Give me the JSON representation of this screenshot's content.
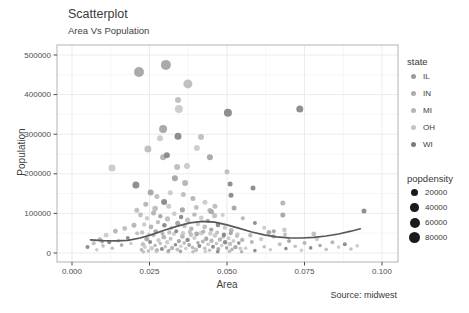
{
  "chart": {
    "title": "Scatterplot",
    "subtitle": "Area Vs Population",
    "xlabel": "Area",
    "ylabel": "Population",
    "caption": "Source: midwest"
  },
  "legend": {
    "state_title": "state",
    "size_title": "popdensity",
    "states": [
      {
        "label": "IL",
        "color": "#9b9b9b"
      },
      {
        "label": "IN",
        "color": "#acacac"
      },
      {
        "label": "MI",
        "color": "#b6b6b6"
      },
      {
        "label": "OH",
        "color": "#c4c4c4"
      },
      {
        "label": "WI",
        "color": "#7b7b7b"
      }
    ],
    "sizes": [
      {
        "label": "20000",
        "d": 7.5
      },
      {
        "label": "40000",
        "d": 8.5
      },
      {
        "label": "60000",
        "d": 10
      },
      {
        "label": "80000",
        "d": 11.5
      }
    ],
    "size_color": "#1a1a1a"
  },
  "chart_data": {
    "type": "scatter",
    "title": "Scatterplot",
    "subtitle": "Area Vs Population",
    "xlabel": "Area",
    "ylabel": "Population",
    "caption": "Source: midwest",
    "xlim": [
      0,
      0.1
    ],
    "ylim": [
      0,
      500000
    ],
    "x_ticks": [
      "0.000",
      "0.025",
      "0.050",
      "0.075",
      "0.100"
    ],
    "y_ticks": [
      "0",
      "100000",
      "200000",
      "300000",
      "400000",
      "500000"
    ],
    "grid": true,
    "legend_position": "right",
    "series_label": "state",
    "size_label": "popdensity",
    "colors": {
      "IL": "#9b9b9b",
      "IN": "#acacac",
      "MI": "#b6b6b6",
      "OH": "#c4c4c4",
      "WI": "#7b7b7b",
      "smooth": "#55585c",
      "grid_major": "#ebebeb",
      "grid_minor": "#f6f6f6",
      "panel_border": "#b3b3b3",
      "tick": "#4d4d4d",
      "size_key": "#1a1a1a"
    },
    "smooth_line": [
      [
        0.006,
        33000
      ],
      [
        0.01,
        31000
      ],
      [
        0.014,
        30500
      ],
      [
        0.018,
        32000
      ],
      [
        0.022,
        38000
      ],
      [
        0.026,
        47000
      ],
      [
        0.03,
        58000
      ],
      [
        0.034,
        68000
      ],
      [
        0.038,
        76000
      ],
      [
        0.042,
        80000
      ],
      [
        0.046,
        78000
      ],
      [
        0.05,
        71000
      ],
      [
        0.054,
        62000
      ],
      [
        0.058,
        53000
      ],
      [
        0.062,
        46000
      ],
      [
        0.066,
        41000
      ],
      [
        0.07,
        38500
      ],
      [
        0.074,
        38000
      ],
      [
        0.078,
        39500
      ],
      [
        0.082,
        43000
      ],
      [
        0.086,
        48000
      ],
      [
        0.09,
        55000
      ],
      [
        0.093,
        61000
      ]
    ],
    "points": [
      [
        0.0216,
        457000,
        "IL",
        5
      ],
      [
        0.0303,
        475000,
        "IL",
        5
      ],
      [
        0.0374,
        427000,
        "MI",
        4.5
      ],
      [
        0.0345,
        364000,
        "OH",
        4
      ],
      [
        0.0342,
        386000,
        "MI",
        3
      ],
      [
        0.0503,
        354000,
        "WI",
        4
      ],
      [
        0.0735,
        364000,
        "WI",
        3.5
      ],
      [
        0.0294,
        313000,
        "IL",
        4
      ],
      [
        0.0342,
        295000,
        "WI",
        3.5
      ],
      [
        0.0416,
        293000,
        "MI",
        3
      ],
      [
        0.0284,
        290000,
        "OH",
        3
      ],
      [
        0.0245,
        263000,
        "MI",
        3.5
      ],
      [
        0.0294,
        242000,
        "IN",
        3
      ],
      [
        0.0306,
        247000,
        "WI",
        3
      ],
      [
        0.0403,
        265000,
        "OH",
        3
      ],
      [
        0.0445,
        242000,
        "IL",
        3
      ],
      [
        0.0129,
        215000,
        "OH",
        3.5
      ],
      [
        0.0206,
        172000,
        "WI",
        3.5
      ],
      [
        0.0339,
        217000,
        "MI",
        3
      ],
      [
        0.0371,
        220000,
        "OH",
        3
      ],
      [
        0.05,
        205000,
        "MI",
        2.5
      ],
      [
        0.051,
        174000,
        "WI",
        2.5
      ],
      [
        0.0332,
        189000,
        "IL",
        3
      ],
      [
        0.0365,
        177000,
        "IN",
        3
      ],
      [
        0.0584,
        164000,
        "WI",
        2.5
      ],
      [
        0.068,
        126000,
        "IN",
        2.5
      ],
      [
        0.068,
        96000,
        "IL",
        2.5
      ],
      [
        0.0942,
        106000,
        "WI",
        2.5
      ],
      [
        0.0297,
        129000,
        "WI",
        3
      ],
      [
        0.0513,
        146000,
        "WI",
        2.5
      ],
      [
        0.0523,
        114000,
        "IL",
        2.5
      ],
      [
        0.0254,
        153000,
        "IL",
        3
      ],
      [
        0.0274,
        143000,
        "MI",
        2.5
      ],
      [
        0.0317,
        152000,
        "OH",
        2.5
      ],
      [
        0.0359,
        148000,
        "MI",
        2.5
      ],
      [
        0.039,
        138000,
        "IN",
        2.5
      ],
      [
        0.0429,
        128000,
        "OH",
        2.5
      ],
      [
        0.0461,
        118000,
        "MI",
        2.5
      ],
      [
        0.0238,
        123000,
        "IN",
        2.5
      ],
      [
        0.0209,
        108000,
        "MI",
        2.5
      ],
      [
        0.045,
        104000,
        "IL",
        2.5
      ],
      [
        0.0486,
        96000,
        "OH",
        2
      ],
      [
        0.0551,
        88000,
        "IN",
        2
      ],
      [
        0.059,
        76000,
        "WI",
        2
      ],
      [
        0.062,
        64000,
        "OH",
        2
      ],
      [
        0.0651,
        55000,
        "IL",
        2
      ],
      [
        0.0687,
        47000,
        "MI",
        2
      ],
      [
        0.0221,
        96000,
        "MI",
        2.4
      ],
      [
        0.0242,
        88000,
        "OH",
        2.2
      ],
      [
        0.0263,
        101000,
        "IN",
        2.5
      ],
      [
        0.0285,
        93000,
        "IL",
        2.2
      ],
      [
        0.0308,
        86000,
        "MI",
        2.6
      ],
      [
        0.033,
        99000,
        "OH",
        2.3
      ],
      [
        0.0352,
        91000,
        "WI",
        2.2
      ],
      [
        0.0373,
        83000,
        "MI",
        2.5
      ],
      [
        0.0395,
        97000,
        "IN",
        2.2
      ],
      [
        0.0417,
        89000,
        "OH",
        2.4
      ],
      [
        0.0438,
        81000,
        "IL",
        2.2
      ],
      [
        0.046,
        94000,
        "MI",
        2.5
      ],
      [
        0.0233,
        72000,
        "OH",
        2.2
      ],
      [
        0.0255,
        66000,
        "IN",
        2.4
      ],
      [
        0.0277,
        78000,
        "MI",
        2.2
      ],
      [
        0.0298,
        70000,
        "WI",
        2.3
      ],
      [
        0.032,
        63000,
        "OH",
        2.2
      ],
      [
        0.0341,
        75000,
        "IL",
        2.5
      ],
      [
        0.0363,
        68000,
        "MI",
        2.2
      ],
      [
        0.0385,
        61000,
        "IN",
        2.3
      ],
      [
        0.0406,
        73000,
        "OH",
        2.2
      ],
      [
        0.0428,
        66000,
        "MI",
        2.4
      ],
      [
        0.0449,
        59000,
        "IL",
        2.2
      ],
      [
        0.0471,
        71000,
        "WI",
        2.3
      ],
      [
        0.0493,
        64000,
        "OH",
        2.2
      ],
      [
        0.0514,
        57000,
        "IN",
        2.4
      ],
      [
        0.0268,
        112000,
        "MI",
        2.8
      ],
      [
        0.0312,
        118000,
        "OH",
        2.5
      ],
      [
        0.0356,
        109000,
        "IL",
        2.6
      ],
      [
        0.0401,
        115000,
        "MI",
        2.4
      ],
      [
        0.0445,
        107000,
        "IN",
        2.5
      ],
      [
        0.0224,
        8000,
        "IN",
        1.8
      ],
      [
        0.0229,
        22000,
        "MI",
        2.2
      ],
      [
        0.0235,
        15000,
        "OH",
        2
      ],
      [
        0.0241,
        35000,
        "IL",
        2.4
      ],
      [
        0.0246,
        5000,
        "MI",
        1.8
      ],
      [
        0.0252,
        28000,
        "WI",
        2
      ],
      [
        0.0257,
        12000,
        "OH",
        2.2
      ],
      [
        0.0263,
        45000,
        "MI",
        2
      ],
      [
        0.0268,
        19000,
        "IN",
        1.8
      ],
      [
        0.0274,
        7000,
        "IL",
        2
      ],
      [
        0.0279,
        32000,
        "OH",
        2.2
      ],
      [
        0.0285,
        24000,
        "MI",
        1.8
      ],
      [
        0.029,
        10000,
        "WI",
        2
      ],
      [
        0.0296,
        40000,
        "IN",
        2.4
      ],
      [
        0.0301,
        16000,
        "MI",
        1.8
      ],
      [
        0.0307,
        27000,
        "OH",
        2.2
      ],
      [
        0.0312,
        6000,
        "IL",
        1.8
      ],
      [
        0.0318,
        36000,
        "MI",
        2
      ],
      [
        0.0323,
        13000,
        "IN",
        2.2
      ],
      [
        0.0329,
        48000,
        "OH",
        2
      ],
      [
        0.0334,
        21000,
        "WI",
        1.8
      ],
      [
        0.034,
        9000,
        "MI",
        2
      ],
      [
        0.0345,
        30000,
        "IL",
        2.2
      ],
      [
        0.0351,
        17000,
        "OH",
        1.8
      ],
      [
        0.0356,
        42000,
        "IN",
        2.4
      ],
      [
        0.0362,
        25000,
        "MI",
        2
      ],
      [
        0.0367,
        11000,
        "OH",
        1.8
      ],
      [
        0.0373,
        33000,
        "WI",
        2.2
      ],
      [
        0.0378,
        20000,
        "IL",
        2
      ],
      [
        0.0384,
        46000,
        "MI",
        2.2
      ],
      [
        0.0389,
        14000,
        "IN",
        1.8
      ],
      [
        0.0395,
        38000,
        "OH",
        2
      ],
      [
        0.04,
        8000,
        "MI",
        2.2
      ],
      [
        0.0406,
        26000,
        "IL",
        1.8
      ],
      [
        0.0411,
        18000,
        "WI",
        2
      ],
      [
        0.0417,
        50000,
        "OH",
        2.4
      ],
      [
        0.0422,
        29000,
        "IN",
        2
      ],
      [
        0.0428,
        12000,
        "MI",
        1.8
      ],
      [
        0.0433,
        36000,
        "IL",
        2.2
      ],
      [
        0.0439,
        22000,
        "OH",
        2
      ],
      [
        0.0444,
        7000,
        "MI",
        1.8
      ],
      [
        0.045,
        31000,
        "IN",
        2.2
      ],
      [
        0.0455,
        16000,
        "WI",
        2
      ],
      [
        0.0461,
        44000,
        "OH",
        2.4
      ],
      [
        0.0466,
        24000,
        "MI",
        1.8
      ],
      [
        0.0472,
        10000,
        "IL",
        2
      ],
      [
        0.0477,
        34000,
        "IN",
        2.2
      ],
      [
        0.0483,
        19000,
        "OH",
        1.8
      ],
      [
        0.0488,
        41000,
        "MI",
        2
      ],
      [
        0.0494,
        27000,
        "WI",
        2.2
      ],
      [
        0.0499,
        13000,
        "IL",
        1.8
      ],
      [
        0.0505,
        37000,
        "OH",
        2
      ],
      [
        0.051,
        23000,
        "MI",
        2.2
      ],
      [
        0.0516,
        9000,
        "IN",
        1.8
      ],
      [
        0.0521,
        30000,
        "OH",
        2
      ],
      [
        0.0527,
        15000,
        "IL",
        2.2
      ],
      [
        0.0532,
        43000,
        "MI",
        2
      ],
      [
        0.0538,
        25000,
        "WI",
        1.8
      ],
      [
        0.0543,
        11000,
        "OH",
        2
      ],
      [
        0.0549,
        33000,
        "IN",
        2.2
      ],
      [
        0.0226,
        52000,
        "MI",
        2.2
      ],
      [
        0.0248,
        47000,
        "OH",
        2
      ],
      [
        0.027,
        54000,
        "IL",
        2.4
      ],
      [
        0.0292,
        49000,
        "IN",
        2
      ],
      [
        0.0314,
        52000,
        "MI",
        2.2
      ],
      [
        0.0336,
        55000,
        "WI",
        2
      ],
      [
        0.0358,
        50000,
        "OH",
        2.2
      ],
      [
        0.038,
        53000,
        "MI",
        2
      ],
      [
        0.0402,
        48000,
        "IL",
        2.4
      ],
      [
        0.0424,
        54000,
        "IN",
        2
      ],
      [
        0.0446,
        49000,
        "OH",
        2.2
      ],
      [
        0.0468,
        52000,
        "MI",
        2
      ],
      [
        0.049,
        46000,
        "WI",
        2.2
      ],
      [
        0.0512,
        50000,
        "IL",
        2
      ],
      [
        0.0534,
        47000,
        "OH",
        2.2
      ],
      [
        0.023,
        3000,
        "MI",
        1.8
      ],
      [
        0.0272,
        4000,
        "OH",
        1.8
      ],
      [
        0.031,
        3000,
        "IN",
        1.8
      ],
      [
        0.035,
        4000,
        "IL",
        1.8
      ],
      [
        0.039,
        3000,
        "MI",
        1.8
      ],
      [
        0.043,
        4000,
        "OH",
        1.8
      ],
      [
        0.047,
        3000,
        "WI",
        1.8
      ],
      [
        0.0508,
        4000,
        "MI",
        1.8
      ],
      [
        0.0547,
        3000,
        "IN",
        1.8
      ],
      [
        0.005,
        15000,
        "WI",
        2
      ],
      [
        0.007,
        25000,
        "MI",
        2.2
      ],
      [
        0.008,
        8000,
        "OH",
        1.8
      ],
      [
        0.009,
        34000,
        "IN",
        2.2
      ],
      [
        0.0097,
        29000,
        "IL",
        2
      ],
      [
        0.01,
        18000,
        "MI",
        1.8
      ],
      [
        0.011,
        45000,
        "OH",
        2.4
      ],
      [
        0.012,
        27000,
        "WI",
        2
      ],
      [
        0.013,
        12000,
        "MI",
        1.8
      ],
      [
        0.014,
        55000,
        "IN",
        2.4
      ],
      [
        0.015,
        31000,
        "OH",
        2
      ],
      [
        0.016,
        20000,
        "IL",
        1.8
      ],
      [
        0.017,
        62000,
        "MI",
        2.4
      ],
      [
        0.018,
        38000,
        "WI",
        2
      ],
      [
        0.019,
        24000,
        "OH",
        1.8
      ],
      [
        0.02,
        70000,
        "IN",
        2.5
      ],
      [
        0.021,
        50000,
        "MI",
        2
      ],
      [
        0.056,
        12000,
        "OH",
        1.8
      ],
      [
        0.0575,
        45000,
        "MI",
        2.2
      ],
      [
        0.058,
        28000,
        "IN",
        2
      ],
      [
        0.059,
        6000,
        "WI",
        1.8
      ],
      [
        0.061,
        35000,
        "OH",
        2.2
      ],
      [
        0.062,
        16000,
        "MI",
        1.8
      ],
      [
        0.0635,
        52000,
        "IL",
        2.4
      ],
      [
        0.064,
        8000,
        "OH",
        1.8
      ],
      [
        0.065,
        42000,
        "IN",
        2.2
      ],
      [
        0.067,
        22000,
        "MI",
        2
      ],
      [
        0.0685,
        58000,
        "OH",
        2.4
      ],
      [
        0.069,
        11000,
        "WI",
        1.8
      ],
      [
        0.07,
        30000,
        "IL",
        2
      ],
      [
        0.072,
        17000,
        "MI",
        1.8
      ],
      [
        0.074,
        7000,
        "OH",
        1.8
      ],
      [
        0.075,
        25000,
        "IN",
        2
      ],
      [
        0.077,
        13000,
        "WI",
        1.8
      ],
      [
        0.078,
        48000,
        "MI",
        2.4
      ],
      [
        0.079,
        35000,
        "OH",
        2.2
      ],
      [
        0.08,
        19000,
        "IL",
        1.8
      ],
      [
        0.082,
        9000,
        "MI",
        1.8
      ],
      [
        0.084,
        27000,
        "IN",
        2
      ],
      [
        0.086,
        15000,
        "OH",
        1.8
      ],
      [
        0.088,
        22000,
        "WI",
        2
      ],
      [
        0.09,
        10000,
        "MI",
        1.8
      ],
      [
        0.092,
        18000,
        "OH",
        1.8
      ]
    ]
  }
}
